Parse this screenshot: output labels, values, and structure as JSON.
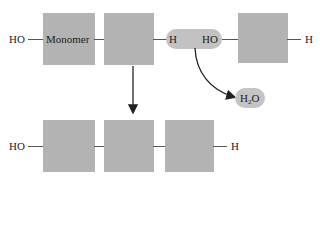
{
  "diagram": {
    "top_row": {
      "left_end_label": "HO",
      "monomer_label": "Monomer",
      "reacting_pair": {
        "h_label": "H",
        "ho_label": "HO"
      },
      "right_end_label": "H"
    },
    "byproduct": {
      "main": "H",
      "subscript": "2",
      "tail": "O"
    },
    "bottom_row": {
      "left_end_label": "HO",
      "right_end_label": "H",
      "monomer_count": 3
    },
    "colors": {
      "monomer_fill": "#b3b3b3",
      "pill_fill": "#c2c2c2",
      "bond": "#555555",
      "arrow": "#222222"
    }
  }
}
